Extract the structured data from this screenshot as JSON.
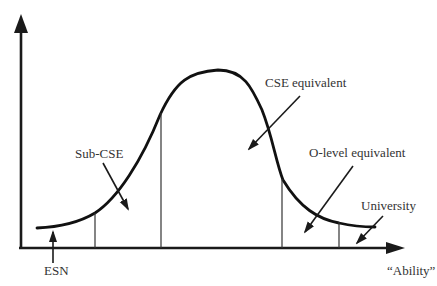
{
  "diagram": {
    "type": "bell-curve distribution of ability",
    "x_axis_label": "“Ability”",
    "regions": [
      {
        "id": "esn",
        "label": "ESN"
      },
      {
        "id": "sub-cse",
        "label": "Sub-CSE"
      },
      {
        "id": "cse",
        "label": "CSE equivalent"
      },
      {
        "id": "o-level",
        "label": "O-level equivalent"
      },
      {
        "id": "university",
        "label": "University"
      }
    ],
    "colors": {
      "line": "#111111",
      "text": "#333333",
      "background": "#ffffff"
    }
  }
}
